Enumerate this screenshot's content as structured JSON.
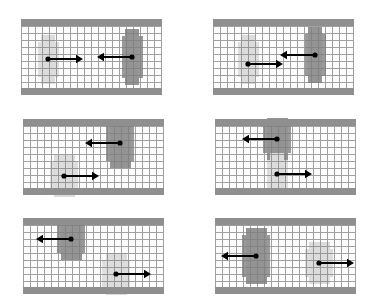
{
  "figure": {
    "panel_count": 6,
    "rows": 3,
    "columns": 2,
    "colors": {
      "wall": "#8f8f8f",
      "grid_line": "#7d7d7d",
      "agent_dark": "#9a9a9a",
      "agent_light": "#dedede",
      "arrow": "#000000",
      "background": "#ffffff"
    },
    "legend_note": "Dark blob = agent A, light blob = agent B, arrow = velocity vector"
  },
  "chart_data": {
    "type": "scatter",
    "xlabel": "",
    "ylabel": "",
    "grid": true,
    "cell_size_px": 7,
    "panels": [
      {
        "id": "panel-1",
        "label": "top-left",
        "corridor": {
          "width": 141,
          "height": 76,
          "wall_thickness": 7
        },
        "agents": [
          {
            "name": "agent-light",
            "shade": "light",
            "cx": 27,
            "cy": 40,
            "w": 21,
            "h": 35,
            "vw": 14,
            "vh": 49,
            "arrow": {
              "x1": 27,
              "y1": 40,
              "x2": 62,
              "y2": 40,
              "direction": "right",
              "length": 35
            }
          },
          {
            "name": "agent-dark",
            "shade": "dark",
            "cx": 111,
            "cy": 38,
            "w": 21,
            "h": 42,
            "vw": 14,
            "vh": 56,
            "arrow": {
              "x1": 111,
              "y1": 38,
              "x2": 76,
              "y2": 38,
              "direction": "left",
              "length": 35
            }
          }
        ]
      },
      {
        "id": "panel-2",
        "label": "top-right",
        "corridor": {
          "width": 141,
          "height": 76,
          "wall_thickness": 7
        },
        "agents": [
          {
            "name": "agent-light",
            "shade": "light",
            "cx": 35,
            "cy": 40,
            "w": 21,
            "h": 35,
            "vw": 14,
            "vh": 49,
            "arrow": {
              "x1": 35,
              "y1": 45,
              "x2": 70,
              "y2": 45,
              "direction": "right",
              "length": 35
            }
          },
          {
            "name": "agent-dark",
            "shade": "dark",
            "cx": 102,
            "cy": 36,
            "w": 21,
            "h": 42,
            "vw": 14,
            "vh": 56,
            "arrow": {
              "x1": 102,
              "y1": 36,
              "x2": 67,
              "y2": 36,
              "direction": "left",
              "length": 35
            }
          }
        ]
      },
      {
        "id": "panel-3",
        "label": "middle-left",
        "corridor": {
          "width": 141,
          "height": 76,
          "wall_thickness": 7
        },
        "agents": [
          {
            "name": "agent-dark",
            "shade": "dark",
            "cx": 97,
            "cy": 24,
            "w": 28,
            "h": 35,
            "vw": 21,
            "vh": 49,
            "arrow": {
              "x1": 97,
              "y1": 24,
              "x2": 62,
              "y2": 24,
              "direction": "left",
              "length": 35
            }
          },
          {
            "name": "agent-light",
            "shade": "light",
            "cx": 41,
            "cy": 57,
            "w": 28,
            "h": 28,
            "vw": 21,
            "vh": 42,
            "arrow": {
              "x1": 41,
              "y1": 57,
              "x2": 76,
              "y2": 57,
              "direction": "right",
              "length": 35
            }
          }
        ]
      },
      {
        "id": "panel-4",
        "label": "middle-right",
        "corridor": {
          "width": 141,
          "height": 76,
          "wall_thickness": 7
        },
        "agents": [
          {
            "name": "agent-dark",
            "shade": "dark",
            "cx": 62,
            "cy": 20,
            "w": 28,
            "h": 28,
            "vw": 21,
            "vh": 42,
            "arrow": {
              "x1": 62,
              "y1": 20,
              "x2": 27,
              "y2": 20,
              "direction": "left",
              "length": 35
            }
          },
          {
            "name": "agent-light",
            "shade": "light",
            "cx": 62,
            "cy": 55,
            "w": 21,
            "h": 28,
            "vw": 14,
            "vh": 42,
            "arrow": {
              "x1": 62,
              "y1": 55,
              "x2": 97,
              "y2": 55,
              "direction": "right",
              "length": 35
            }
          }
        ]
      },
      {
        "id": "panel-5",
        "label": "bottom-left",
        "corridor": {
          "width": 141,
          "height": 76,
          "wall_thickness": 7
        },
        "agents": [
          {
            "name": "agent-dark",
            "shade": "dark",
            "cx": 48,
            "cy": 21,
            "w": 28,
            "h": 28,
            "vw": 21,
            "vh": 42,
            "arrow": {
              "x1": 48,
              "y1": 21,
              "x2": 13,
              "y2": 21,
              "direction": "left",
              "length": 35
            }
          },
          {
            "name": "agent-light",
            "shade": "light",
            "cx": 93,
            "cy": 56,
            "w": 28,
            "h": 28,
            "vw": 21,
            "vh": 42,
            "arrow": {
              "x1": 93,
              "y1": 56,
              "x2": 128,
              "y2": 56,
              "direction": "right",
              "length": 35
            }
          }
        ]
      },
      {
        "id": "panel-6",
        "label": "bottom-right",
        "corridor": {
          "width": 141,
          "height": 76,
          "wall_thickness": 7
        },
        "agents": [
          {
            "name": "agent-dark",
            "shade": "dark",
            "cx": 41,
            "cy": 38,
            "w": 28,
            "h": 42,
            "vw": 21,
            "vh": 56,
            "arrow": {
              "x1": 41,
              "y1": 38,
              "x2": 6,
              "y2": 38,
              "direction": "left",
              "length": 35
            }
          },
          {
            "name": "agent-light",
            "shade": "light",
            "cx": 104,
            "cy": 45,
            "w": 28,
            "h": 28,
            "vw": 21,
            "vh": 42,
            "arrow": {
              "x1": 104,
              "y1": 45,
              "x2": 139,
              "y2": 45,
              "direction": "right",
              "length": 35
            }
          }
        ]
      }
    ]
  }
}
